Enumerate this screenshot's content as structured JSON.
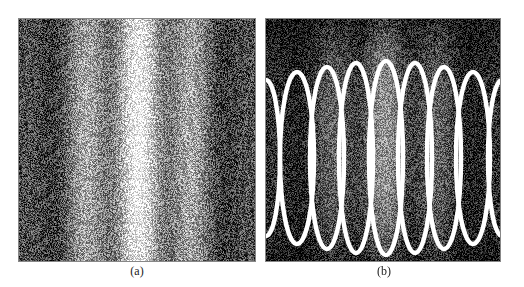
{
  "figure": {
    "panels": [
      {
        "label": "(a)",
        "description": "noisy vertical interference fringe intensity pattern, bright center fading to dark bands at edges",
        "fringe_count": 8
      },
      {
        "label": "(b)",
        "description": "same fringe pattern darkened with white fitted elliptical contours overlaid on each bright fringe",
        "ellipse_count": 7,
        "partial_edge_ellipses": 2
      }
    ]
  },
  "colors": {
    "background": "#ffffff",
    "contour": "#ffffff",
    "border": "#888888"
  }
}
